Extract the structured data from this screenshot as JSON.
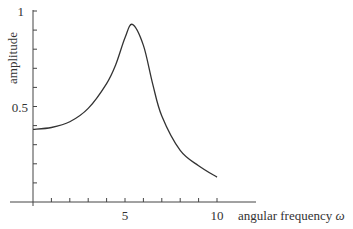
{
  "chart_data": {
    "type": "line",
    "title": "",
    "xlabel": "angular frequency ω",
    "ylabel": "amplitude",
    "xlim": [
      0,
      10.5
    ],
    "ylim": [
      0,
      1
    ],
    "x_ticks_labeled": [
      "5",
      "10"
    ],
    "y_ticks_labeled": [
      "0.5",
      "1"
    ],
    "x_minor_tick_step": 1,
    "y_minor_tick_step": 0.1,
    "grid": false,
    "legend": null,
    "series": [
      {
        "name": "amplitude",
        "x": [
          0,
          1,
          2,
          3,
          4,
          4.5,
          5,
          5.4,
          6,
          6.5,
          7,
          8,
          9,
          10
        ],
        "values": [
          0.38,
          0.39,
          0.42,
          0.49,
          0.62,
          0.72,
          0.86,
          0.93,
          0.82,
          0.62,
          0.45,
          0.27,
          0.19,
          0.13
        ]
      }
    ]
  },
  "labels": {
    "xlabel_text": "angular frequency ",
    "xlabel_symbol": "ω",
    "ylabel": "amplitude",
    "ytick_half": "0.5",
    "ytick_one": "1",
    "xtick_five": "5",
    "xtick_ten": "10"
  }
}
